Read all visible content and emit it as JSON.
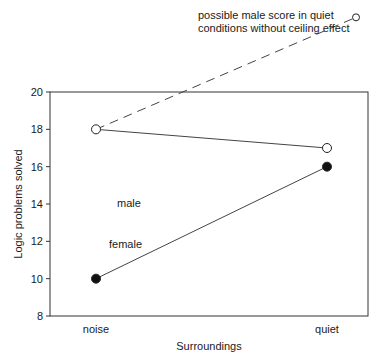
{
  "chart_data": {
    "type": "line",
    "title": "",
    "xlabel": "Surroundings",
    "ylabel": "Logic problems solved",
    "categories": [
      "noise",
      "quiet"
    ],
    "ylim": [
      8,
      20
    ],
    "yticks": [
      8,
      10,
      12,
      14,
      16,
      18,
      20
    ],
    "grid": false,
    "series": [
      {
        "name": "male",
        "values": [
          18,
          17
        ],
        "marker": "open-circle",
        "line": "solid"
      },
      {
        "name": "female",
        "values": [
          10,
          16
        ],
        "marker": "filled-circle",
        "line": "solid"
      },
      {
        "name": "possible male score in quiet conditions without ceiling effect",
        "values": [
          18,
          24
        ],
        "marker": "open-circle",
        "line": "dashed"
      }
    ],
    "annotations": [
      {
        "text": "male",
        "near": "male series, below noise point"
      },
      {
        "text": "female",
        "near": "female series, above noise point"
      },
      {
        "text_lines": [
          "possible male score in quiet",
          "conditions without ceiling effect"
        ],
        "near": "dashed series end, above plot"
      }
    ]
  }
}
